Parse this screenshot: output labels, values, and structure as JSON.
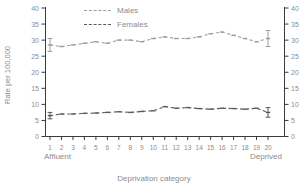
{
  "figure": {
    "background": "#ffffff",
    "axis_color": "#3a3a3a",
    "tick_text_color": "#8c8c8c"
  },
  "chart_data": {
    "type": "line",
    "title": "",
    "xlabel": "Deprivation category",
    "ylabel": "Rate per 100,000",
    "x_left_label": "Affluent",
    "x_right_label": "Deprived",
    "categories": [
      1,
      2,
      3,
      4,
      5,
      6,
      7,
      8,
      9,
      10,
      11,
      12,
      13,
      14,
      15,
      16,
      17,
      18,
      19,
      20
    ],
    "ylim": [
      0,
      40
    ],
    "yticks": [
      0,
      5,
      10,
      15,
      20,
      25,
      30,
      35,
      40
    ],
    "y_axis_sides": "both",
    "grid": false,
    "legend_position": "top-inside",
    "line_style": "dashed",
    "series": [
      {
        "name": "Males",
        "color": "#9e9e9e",
        "values": [
          28.5,
          28,
          28.5,
          29,
          29.5,
          29,
          30,
          30,
          29.5,
          30.5,
          31,
          30.5,
          30.5,
          31,
          32,
          32.5,
          31.5,
          30.5,
          29.5,
          30.5
        ],
        "error_bars": [
          {
            "category": 1,
            "low": 26.5,
            "high": 30.5
          },
          {
            "category": 20,
            "low": 28,
            "high": 33
          }
        ]
      },
      {
        "name": "Females",
        "color": "#595959",
        "values": [
          6.5,
          7,
          7,
          7.2,
          7.3,
          7.5,
          7.7,
          7.5,
          7.8,
          8,
          9.3,
          8.8,
          9,
          8.7,
          8.5,
          8.8,
          8.7,
          8.5,
          8.8,
          7.5
        ],
        "error_bars": [
          {
            "category": 1,
            "low": 5.5,
            "high": 7.5
          },
          {
            "category": 20,
            "low": 6,
            "high": 9
          }
        ]
      }
    ]
  }
}
